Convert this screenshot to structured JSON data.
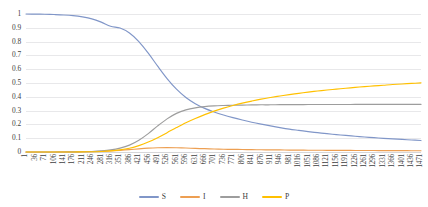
{
  "chart_data": {
    "type": "line",
    "title": "",
    "xlabel": "",
    "ylabel": "",
    "ylim": [
      0,
      1
    ],
    "xlim": [
      1,
      1471
    ],
    "grid": true,
    "legend_position": "bottom",
    "y_ticks": [
      "0",
      "0.1",
      "0.2",
      "0.3",
      "0.4",
      "0.5",
      "0.6",
      "0.7",
      "0.8",
      "0.9",
      "1"
    ],
    "x_ticks": [
      "1",
      "36",
      "71",
      "106",
      "141",
      "176",
      "211",
      "246",
      "281",
      "316",
      "351",
      "386",
      "421",
      "456",
      "491",
      "526",
      "561",
      "596",
      "631",
      "666",
      "701",
      "736",
      "771",
      "806",
      "841",
      "876",
      "911",
      "946",
      "981",
      "1016",
      "1051",
      "1086",
      "1121",
      "1156",
      "1191",
      "1226",
      "1261",
      "1296",
      "1331",
      "1366",
      "1401",
      "1436",
      "1471"
    ],
    "x": [
      1,
      36,
      71,
      106,
      141,
      176,
      211,
      246,
      281,
      316,
      351,
      386,
      421,
      456,
      491,
      526,
      561,
      596,
      631,
      666,
      701,
      736,
      771,
      806,
      841,
      876,
      911,
      946,
      981,
      1016,
      1051,
      1086,
      1121,
      1156,
      1191,
      1226,
      1261,
      1296,
      1331,
      1366,
      1401,
      1436,
      1471
    ],
    "series": [
      {
        "name": "S",
        "color": "#8096c8",
        "values": [
          1.0,
          0.999,
          0.998,
          0.996,
          0.993,
          0.988,
          0.979,
          0.965,
          0.941,
          0.911,
          0.898,
          0.862,
          0.8,
          0.716,
          0.622,
          0.532,
          0.455,
          0.395,
          0.35,
          0.316,
          0.29,
          0.268,
          0.249,
          0.232,
          0.216,
          0.202,
          0.189,
          0.177,
          0.166,
          0.157,
          0.148,
          0.14,
          0.133,
          0.126,
          0.12,
          0.114,
          0.109,
          0.104,
          0.099,
          0.095,
          0.091,
          0.087,
          0.083
        ]
      },
      {
        "name": "I",
        "color": "#ed9f52",
        "values": [
          0.0,
          0.0,
          0.0,
          0.0,
          0.001,
          0.001,
          0.002,
          0.003,
          0.005,
          0.008,
          0.012,
          0.017,
          0.023,
          0.028,
          0.031,
          0.032,
          0.031,
          0.029,
          0.026,
          0.024,
          0.022,
          0.02,
          0.019,
          0.018,
          0.017,
          0.016,
          0.015,
          0.015,
          0.014,
          0.014,
          0.013,
          0.013,
          0.012,
          0.012,
          0.012,
          0.011,
          0.011,
          0.011,
          0.01,
          0.01,
          0.01,
          0.009,
          0.009
        ]
      },
      {
        "name": "H",
        "color": "#9d9d9d",
        "values": [
          0.0,
          0.0,
          0.0,
          0.0,
          0.0,
          0.001,
          0.002,
          0.004,
          0.008,
          0.015,
          0.028,
          0.05,
          0.085,
          0.133,
          0.189,
          0.24,
          0.28,
          0.305,
          0.32,
          0.329,
          0.334,
          0.337,
          0.339,
          0.34,
          0.341,
          0.342,
          0.342,
          0.343,
          0.343,
          0.343,
          0.344,
          0.344,
          0.344,
          0.344,
          0.344,
          0.345,
          0.345,
          0.345,
          0.345,
          0.345,
          0.345,
          0.345,
          0.345
        ]
      },
      {
        "name": "P",
        "color": "#ffc000",
        "values": [
          0.0,
          0.0,
          0.0,
          0.0,
          0.0,
          0.0,
          0.001,
          0.002,
          0.004,
          0.008,
          0.015,
          0.027,
          0.046,
          0.072,
          0.104,
          0.14,
          0.177,
          0.212,
          0.243,
          0.271,
          0.296,
          0.318,
          0.337,
          0.354,
          0.369,
          0.383,
          0.395,
          0.406,
          0.416,
          0.425,
          0.434,
          0.442,
          0.449,
          0.456,
          0.462,
          0.468,
          0.474,
          0.479,
          0.484,
          0.489,
          0.493,
          0.497,
          0.501
        ]
      }
    ]
  },
  "legend": {
    "items": [
      {
        "label": "S"
      },
      {
        "label": "I"
      },
      {
        "label": "H"
      },
      {
        "label": "P"
      }
    ]
  }
}
